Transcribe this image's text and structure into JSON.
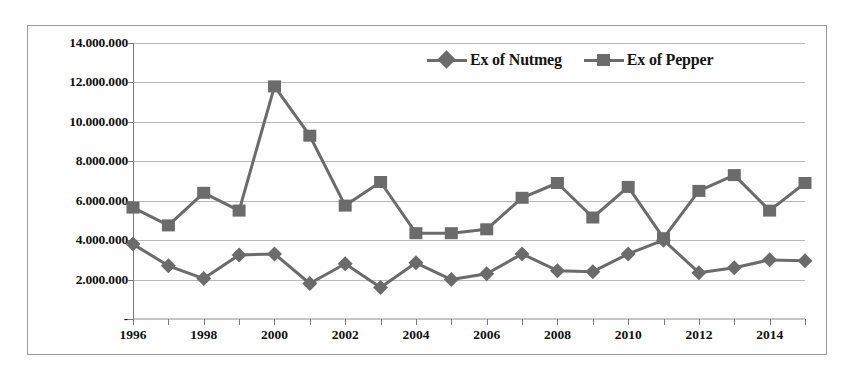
{
  "chart_data": {
    "type": "line",
    "title": "",
    "xlabel": "",
    "ylabel": "",
    "x": [
      1996,
      1997,
      1998,
      1999,
      2000,
      2001,
      2002,
      2003,
      2004,
      2005,
      2006,
      2007,
      2008,
      2009,
      2010,
      2011,
      2012,
      2013,
      2014,
      2015
    ],
    "xtick_labels": [
      "1996",
      "",
      "1998",
      "",
      "2000",
      "",
      "2002",
      "",
      "2004",
      "",
      "2006",
      "",
      "2008",
      "",
      "2010",
      "",
      "2012",
      "",
      "2014",
      ""
    ],
    "ytick_labels": [
      "-",
      "2.000.000",
      "4.000.000",
      "6.000.000",
      "8.000.000",
      "10.000.000",
      "12.000.000",
      "14.000.000"
    ],
    "ytick_values": [
      0,
      2000000,
      4000000,
      6000000,
      8000000,
      10000000,
      12000000,
      14000000
    ],
    "ylim": [
      0,
      14000000
    ],
    "xlim": [
      1996,
      2015
    ],
    "grid": true,
    "legend_position": "top-right",
    "series": [
      {
        "name": "Ex of Nutmeg",
        "marker": "diamond",
        "color": "#6b6b6b",
        "values": [
          3800000,
          2700000,
          2050000,
          3250000,
          3300000,
          1800000,
          2800000,
          1600000,
          2850000,
          2000000,
          2300000,
          3300000,
          2450000,
          2400000,
          3300000,
          4000000,
          2350000,
          2600000,
          3000000,
          2950000
        ]
      },
      {
        "name": "Ex of Pepper",
        "marker": "square",
        "color": "#6b6b6b",
        "values": [
          5650000,
          4750000,
          6400000,
          5500000,
          11800000,
          9300000,
          5750000,
          6950000,
          4350000,
          4350000,
          4550000,
          6150000,
          6900000,
          5150000,
          6700000,
          4100000,
          6500000,
          7300000,
          5500000,
          6900000
        ]
      }
    ]
  }
}
